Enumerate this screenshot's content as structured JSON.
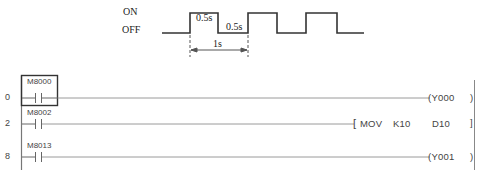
{
  "timing_diagram": {
    "on_label": "ON",
    "off_label": "OFF",
    "high_duration_label": "0.5s",
    "low_duration_label": "0.5s",
    "period_label": "1s"
  },
  "ladder": {
    "rungs": [
      {
        "step": "0",
        "contact": "M8000",
        "output_type": "coil",
        "coil": "Y000",
        "close": ")"
      },
      {
        "step": "2",
        "contact": "M8002",
        "output_type": "instruction",
        "instruction": "MOV",
        "operand1": "K10",
        "operand2": "D10",
        "open": "[",
        "close": "]"
      },
      {
        "step": "8",
        "contact": "M8013",
        "output_type": "coil",
        "coil": "Y001",
        "close": ")"
      }
    ]
  },
  "colors": {
    "line": "#333333",
    "rail": "#777777",
    "wire": "#9a9a9a"
  }
}
